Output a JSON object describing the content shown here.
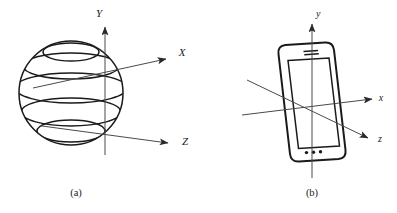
{
  "figure": {
    "background_color": "#ffffff",
    "ink_color": "#1a1a1a",
    "axis_color": "#4a4a4a",
    "width": 397,
    "height": 213
  },
  "panels": [
    {
      "id": "a",
      "caption": "(a)",
      "subject": "sphere",
      "subject_name": "sphere-globe",
      "axes": [
        {
          "name": "y-axis",
          "label": "Y",
          "direction": "up"
        },
        {
          "name": "x-axis",
          "label": "X",
          "direction": "up-right"
        },
        {
          "name": "z-axis",
          "label": "Z",
          "direction": "down-right"
        }
      ],
      "latitude_line_count": 5
    },
    {
      "id": "b",
      "caption": "(b)",
      "subject": "smartphone",
      "subject_name": "smartphone-device",
      "axes": [
        {
          "name": "y-axis",
          "label": "y",
          "direction": "up"
        },
        {
          "name": "x-axis",
          "label": "x",
          "direction": "right"
        },
        {
          "name": "z-axis",
          "label": "z",
          "direction": "down-right"
        }
      ],
      "phone_features": [
        "earpiece-speaker",
        "screen",
        "home-button-dots"
      ],
      "home_button_dot_count": 3
    }
  ]
}
